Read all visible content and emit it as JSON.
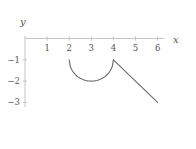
{
  "chart_data": {
    "type": "line",
    "title": "",
    "xlabel": "x",
    "ylabel": "y",
    "xlim": [
      0,
      6.3
    ],
    "ylim": [
      -3.2,
      0.1
    ],
    "grid": false,
    "legend": null,
    "x_ticks": [
      1,
      2,
      3,
      4,
      5,
      6
    ],
    "x_tick_labels": [
      "1",
      "2",
      "3",
      "4",
      "5",
      "6"
    ],
    "y_ticks": [
      -1,
      -2,
      -3
    ],
    "y_tick_labels": [
      "−1",
      "−2",
      "−3"
    ],
    "series": [
      {
        "name": "semicircle",
        "description": "lower half of circle centered at (3,-1), radius 1",
        "x": [
          2,
          2.1,
          2.25,
          2.5,
          2.75,
          3,
          3.25,
          3.5,
          3.75,
          3.9,
          4
        ],
        "y": [
          -1,
          -1.436,
          -1.661,
          -1.866,
          -1.968,
          -2,
          -1.968,
          -1.866,
          -1.661,
          -1.436,
          -1
        ]
      },
      {
        "name": "line",
        "x": [
          4,
          6
        ],
        "y": [
          -1,
          -3
        ]
      }
    ],
    "colors": {
      "axis": "#c4c4c4",
      "series": "#6a6a6a",
      "labels": "#555555"
    }
  }
}
